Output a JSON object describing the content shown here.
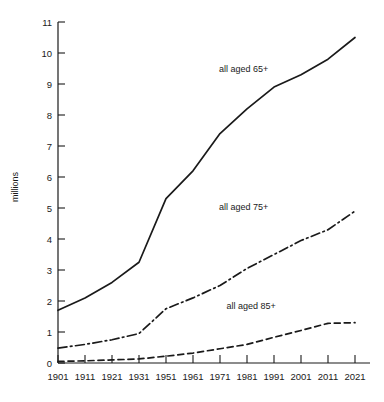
{
  "chart_data": {
    "type": "line",
    "title": "",
    "subtitle": "",
    "xlabel": "",
    "ylabel": "millions",
    "grid": false,
    "legend_position": "inline-annotations",
    "x": [
      1901,
      1911,
      1921,
      1931,
      1951,
      1961,
      1971,
      1981,
      1991,
      2001,
      2011,
      2021
    ],
    "xtick_labels": [
      "1901",
      "1911",
      "1921",
      "1931",
      "1951",
      "1961",
      "1971",
      "1981",
      "1991",
      "2001",
      "2011",
      "2021"
    ],
    "ytick_labels": [
      "0",
      "1",
      "2",
      "3",
      "4",
      "5",
      "6",
      "7",
      "8",
      "9",
      "10",
      "11"
    ],
    "ylim": [
      0,
      11
    ],
    "xlim": [
      1901,
      2021
    ],
    "series": [
      {
        "name": "all aged 65+",
        "label": "all aged 65+",
        "style": "solid",
        "color": "#1a1a1a",
        "values": [
          1.7,
          2.1,
          2.6,
          3.25,
          5.3,
          6.2,
          7.4,
          8.2,
          8.9,
          9.3,
          9.8,
          10.5
        ]
      },
      {
        "name": "all aged 75+",
        "label": "all aged 75+",
        "style": "dash-dot",
        "color": "#1a1a1a",
        "values": [
          0.48,
          0.6,
          0.75,
          0.95,
          1.75,
          2.1,
          2.5,
          3.05,
          3.5,
          3.95,
          4.3,
          4.9
        ]
      },
      {
        "name": "all aged 85+",
        "label": "all aged 85+",
        "style": "dashed",
        "color": "#1a1a1a",
        "values": [
          0.05,
          0.07,
          0.1,
          0.13,
          0.22,
          0.32,
          0.46,
          0.6,
          0.83,
          1.05,
          1.28,
          1.3
        ]
      }
    ],
    "annotations": [
      {
        "text": "all aged 65+",
        "x": 1976,
        "y": 9.4
      },
      {
        "text": "all aged 75+",
        "x": 1976,
        "y": 4.95
      },
      {
        "text": "all aged 85+",
        "x": 1979,
        "y": 1.75
      }
    ]
  }
}
